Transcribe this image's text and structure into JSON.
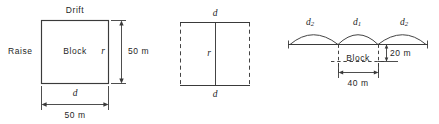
{
  "figure": {
    "line_color": "#3a3a3a",
    "background": "#ffffff"
  },
  "plan_view": {
    "drift_label": "Drift",
    "raise_label": "Raise",
    "block_label": "Block",
    "height_symbol": "r",
    "width_symbol": "d",
    "height_dimension": "50 m",
    "width_dimension": "50 m"
  },
  "middle_view": {
    "top_symbol": "d",
    "bottom_symbol": "d",
    "center_symbol": "r"
  },
  "elevation_view": {
    "arch_left_symbol": "d",
    "arch_left_subscript": "2",
    "arch_center_symbol": "d",
    "arch_center_subscript": "1",
    "arch_right_symbol": "d",
    "arch_right_subscript": "2",
    "block_label": "Block",
    "height_dimension": "20 m",
    "width_dimension": "40 m"
  }
}
